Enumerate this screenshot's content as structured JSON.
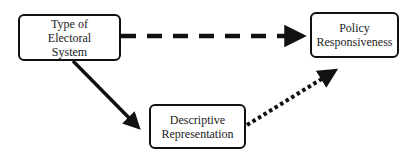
{
  "diagram": {
    "nodes": [
      {
        "id": "electoral",
        "lines": [
          "Type of",
          "Electoral",
          "System"
        ]
      },
      {
        "id": "policy",
        "lines": [
          "Policy",
          "Responsiveness"
        ]
      },
      {
        "id": "descriptive",
        "lines": [
          "Descriptive",
          "Representation"
        ]
      }
    ],
    "edges": [
      {
        "from": "electoral",
        "to": "policy",
        "style": "dashed"
      },
      {
        "from": "electoral",
        "to": "descriptive",
        "style": "solid"
      },
      {
        "from": "descriptive",
        "to": "policy",
        "style": "dotted"
      }
    ]
  }
}
